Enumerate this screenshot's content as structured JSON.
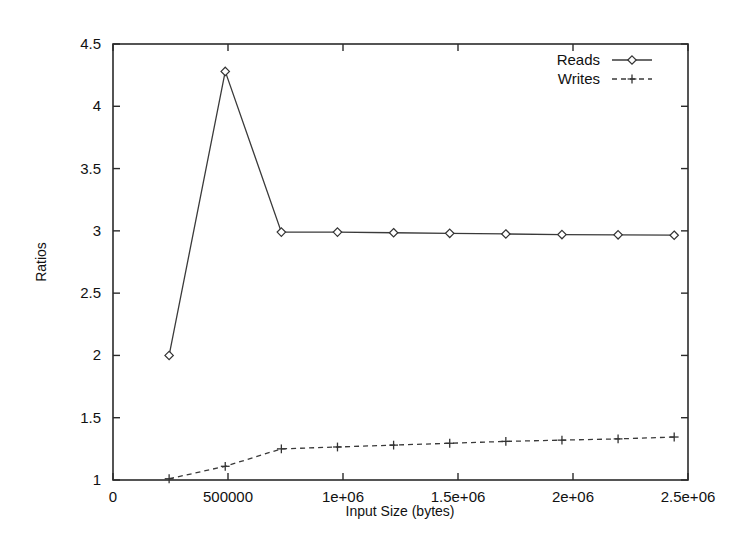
{
  "chart_data": {
    "type": "line",
    "title": "",
    "xlabel": "Input Size (bytes)",
    "ylabel": "Ratios",
    "xlim": [
      0,
      2500000
    ],
    "ylim": [
      1,
      4.5
    ],
    "grid": false,
    "legend_position": "top-right",
    "x_ticks": [
      {
        "value": 0,
        "label": "0"
      },
      {
        "value": 500000,
        "label": "500000"
      },
      {
        "value": 1000000,
        "label": "1e+06"
      },
      {
        "value": 1500000,
        "label": "1.5e+06"
      },
      {
        "value": 2000000,
        "label": "2e+06"
      },
      {
        "value": 2500000,
        "label": "2.5e+06"
      }
    ],
    "y_ticks": [
      {
        "value": 1,
        "label": "1"
      },
      {
        "value": 1.5,
        "label": "1.5"
      },
      {
        "value": 2,
        "label": "2"
      },
      {
        "value": 2.5,
        "label": "2.5"
      },
      {
        "value": 3,
        "label": "3"
      },
      {
        "value": 3.5,
        "label": "3.5"
      },
      {
        "value": 4,
        "label": "4"
      },
      {
        "value": 4.5,
        "label": "4.5"
      }
    ],
    "x": [
      244000,
      488000,
      732000,
      976000,
      1220000,
      1464000,
      1708000,
      1952000,
      2196000,
      2440000
    ],
    "series": [
      {
        "name": "Reads",
        "marker": "diamond",
        "line_style": "solid",
        "color": "#3a3a3a",
        "values": [
          2.0,
          4.28,
          2.99,
          2.99,
          2.985,
          2.98,
          2.975,
          2.97,
          2.968,
          2.965
        ]
      },
      {
        "name": "Writes",
        "marker": "plus",
        "line_style": "dashed",
        "color": "#3a3a3a",
        "values": [
          1.01,
          1.11,
          1.25,
          1.265,
          1.28,
          1.295,
          1.31,
          1.32,
          1.33,
          1.345
        ]
      }
    ]
  },
  "legend": {
    "entries": [
      {
        "label": "Reads"
      },
      {
        "label": "Writes"
      }
    ]
  },
  "axes": {
    "x_title": "Input Size (bytes)",
    "y_title": "Ratios"
  }
}
